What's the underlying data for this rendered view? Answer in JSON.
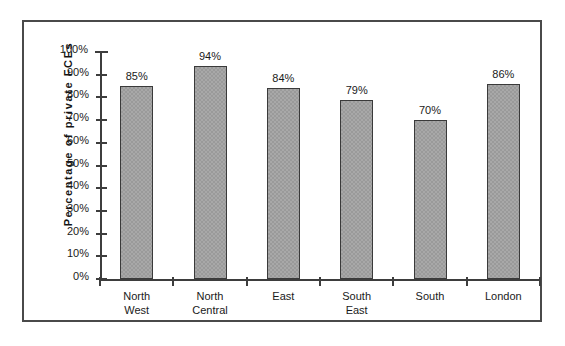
{
  "chart_data": {
    "type": "bar",
    "title": "",
    "xlabel": "",
    "ylabel": "Percentage  of  private  FCEs",
    "categories": [
      "North West",
      "North Central",
      "East",
      "South East",
      "South",
      "London"
    ],
    "category_lines": [
      [
        "North",
        "West"
      ],
      [
        "North",
        "Central"
      ],
      [
        "East"
      ],
      [
        "South",
        "East"
      ],
      [
        "South"
      ],
      [
        "London"
      ]
    ],
    "values": [
      85,
      94,
      84,
      79,
      70,
      86
    ],
    "value_labels": [
      "85%",
      "94%",
      "84%",
      "79%",
      "70%",
      "86%"
    ],
    "ylim": [
      0,
      100
    ],
    "ytick_values": [
      100,
      90,
      80,
      70,
      60,
      50,
      40,
      30,
      20,
      10,
      0
    ],
    "ytick_labels": [
      "100%",
      "90%",
      "80%",
      "70%",
      "60%",
      "50%",
      "40%",
      "30%",
      "20%",
      "10%",
      "0%"
    ],
    "grid": false,
    "legend": null,
    "bar_color": "#9a9a9a",
    "bar_edge_color": "#3a3a3a",
    "axis_color": "#3d3d3d",
    "frame_color": "#4a4a4a",
    "background_color": "#ffffff"
  }
}
